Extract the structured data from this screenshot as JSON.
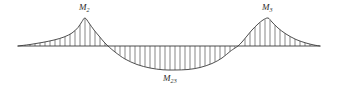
{
  "figure": {
    "type": "bending-moment-diagram",
    "background_color": "#ffffff",
    "curve_color": "#3a3a3a",
    "hatch_color": "#555555",
    "baseline_color": "#3a3a3a",
    "label_color": "#2b2b2b"
  },
  "labels": {
    "left_peak": {
      "symbol": "M",
      "subscript": "2",
      "x": 85,
      "y": 12
    },
    "right_peak": {
      "symbol": "M",
      "subscript": "3",
      "x": 268,
      "y": 12
    },
    "mid_span": {
      "symbol": "M",
      "subscript": "23",
      "x": 175,
      "y": 80
    }
  },
  "chart_data": {
    "type": "area",
    "title": "",
    "subtitle": "",
    "xlabel": "",
    "ylabel": "",
    "grid": false,
    "legend_position": "none",
    "axis_baseline_y": 46,
    "xlim": [
      18,
      320
    ],
    "ylim": [
      70,
      18
    ],
    "annotations": [
      "M2",
      "M3",
      "M23"
    ],
    "series": [
      {
        "name": "Bending moment",
        "description": "Continuous-beam bending moment: hogging peaks over the two interior supports and a sagging region in the mid span.",
        "x": [
          18,
          30,
          42,
          54,
          64,
          72,
          78,
          82,
          85,
          89,
          94,
          99,
          104,
          108,
          115,
          125,
          137,
          150,
          163,
          175,
          188,
          200,
          212,
          222,
          230,
          235,
          238,
          242,
          247,
          252,
          258,
          263,
          268,
          272,
          278,
          286,
          296,
          306,
          314,
          320
        ],
        "y": [
          46,
          44.5,
          42.5,
          40,
          37,
          33,
          27.5,
          21.5,
          18,
          23,
          30,
          36,
          42,
          46,
          52,
          59,
          64.5,
          68,
          69.8,
          70,
          69.5,
          67.5,
          63.5,
          58,
          51.5,
          48,
          46,
          42,
          36,
          30,
          24,
          20,
          18,
          22,
          28,
          34,
          39.5,
          43,
          45,
          46
        ]
      }
    ],
    "hatching": {
      "orientation": "vertical",
      "spacing_px": 5,
      "line_width_px": 0.7,
      "regions": [
        {
          "name": "left-hogging",
          "x_start": 22,
          "x_end": 106
        },
        {
          "name": "mid-sagging",
          "x_start": 112,
          "x_end": 235
        },
        {
          "name": "right-hogging",
          "x_start": 241,
          "x_end": 316
        }
      ]
    }
  }
}
